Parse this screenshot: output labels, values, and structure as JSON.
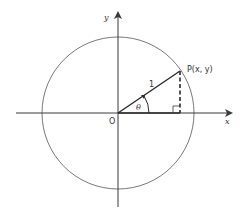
{
  "figure": {
    "type": "unit-circle",
    "colors": {
      "stroke": "#3a3a3a",
      "circle": "#6a6a6a",
      "background": "#ffffff"
    },
    "labels": {
      "x_axis": "x",
      "y_axis": "y",
      "origin": "O",
      "point": "P(x, y)",
      "radius": "1",
      "angle": "θ"
    },
    "geometry": {
      "origin": [
        118,
        113
      ],
      "radius_px": 76,
      "point": [
        180,
        71
      ],
      "x_axis_range": [
        16,
        230
      ],
      "y_axis_range": [
        14,
        207
      ]
    }
  }
}
